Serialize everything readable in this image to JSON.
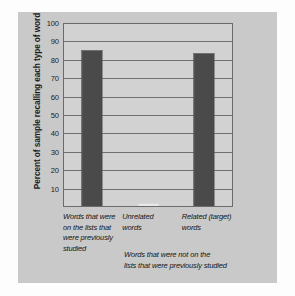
{
  "chart_data": {
    "type": "bar",
    "title": "",
    "xlabel": "",
    "ylabel": "Percent of sample recalling each type of word",
    "ylim": [
      0,
      100
    ],
    "yticks": [
      100,
      90,
      80,
      70,
      60,
      50,
      40,
      30,
      20,
      10
    ],
    "grid": true,
    "legend": "none",
    "categories": [
      "Words that were on the lists that were previously studied",
      "Unrelated words",
      "Related (target) words"
    ],
    "category_lines": [
      [
        "Words that were",
        "on the lists that",
        "were previously",
        "studied"
      ],
      [
        "Unrelated",
        "words"
      ],
      [
        "Related (target)",
        "words"
      ]
    ],
    "values": [
      85,
      0,
      83
    ],
    "annotations": [
      "Words that were not on the lists that were previously studied"
    ],
    "annotation_lines": [
      "Words that were not on the",
      "lists that were previously studied"
    ],
    "colors": {
      "bar": "#4a4a4a",
      "plot_background": "#d2d2d2",
      "panel_background": "#c9c9c9",
      "gridline": "#6f6f6f",
      "frame": "#6b6b6b",
      "text": "#141414"
    }
  }
}
